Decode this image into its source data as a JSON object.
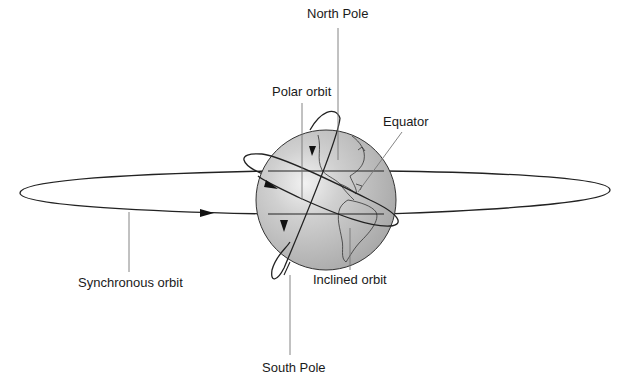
{
  "diagram": {
    "type": "orbit-types-illustration",
    "labels": {
      "north_pole": "North Pole",
      "polar_orbit": "Polar orbit",
      "equator": "Equator",
      "synchronous_orbit": "Synchronous orbit",
      "inclined_orbit": "Inclined orbit",
      "south_pole": "South Pole"
    },
    "colors": {
      "globe_fill": "#c4c4c4",
      "globe_highlight": "#f0f0f0",
      "line": "#222222",
      "leader": "#777777",
      "background": "#ffffff"
    }
  }
}
